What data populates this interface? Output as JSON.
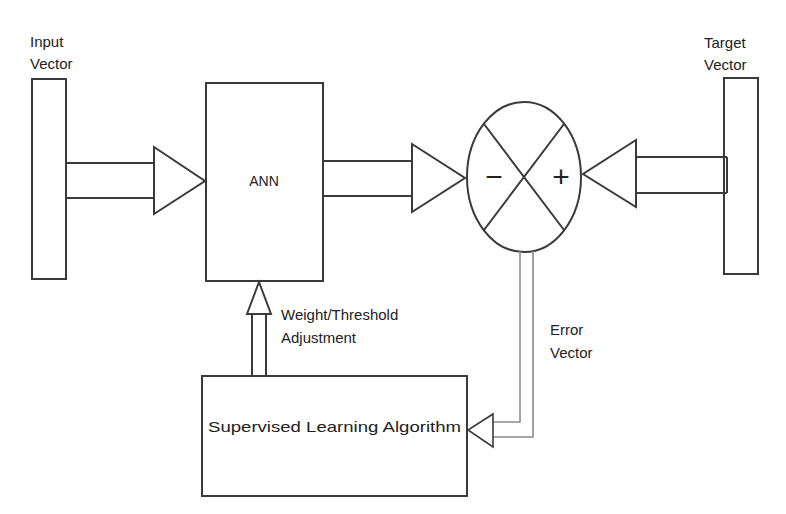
{
  "diagram": {
    "colors": {
      "stroke": "#3a3a3a",
      "text": "#222222",
      "background": "#ffffff"
    },
    "nodes": {
      "input_vector": {
        "label_line1": "Input",
        "label_line2": "Vector"
      },
      "ann": {
        "label": "ANN"
      },
      "comparator": {
        "minus": "−",
        "plus": "+"
      },
      "target_vector": {
        "label_line1": "Target",
        "label_line2": "Vector"
      },
      "learning_algorithm": {
        "label": "Supervised Learning Algorithm"
      }
    },
    "edges": {
      "weight_adjustment": {
        "label_line1": "Weight/Threshold",
        "label_line2": "Adjustment"
      },
      "error_vector": {
        "label_line1": "Error",
        "label_line2": "Vector"
      }
    }
  }
}
